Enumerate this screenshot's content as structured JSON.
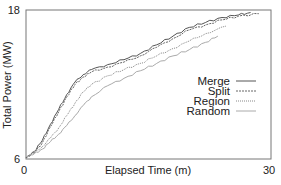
{
  "chart_data": {
    "type": "line",
    "title": "",
    "xlabel": "Elapsed Time (m)",
    "ylabel": "Total Power (MW)",
    "xlim": [
      0,
      30
    ],
    "ylim": [
      6,
      18
    ],
    "x_ticks": [
      "0",
      "30"
    ],
    "y_ticks": [
      "6",
      "18"
    ],
    "grid": false,
    "legend_position": "center-right",
    "series": [
      {
        "name": "Merge",
        "style": "solid",
        "color": "#555555",
        "x": [
          0,
          1,
          2,
          3,
          4,
          5,
          6,
          7,
          8,
          10,
          12,
          14,
          16,
          18,
          20,
          22,
          24,
          26,
          27.5
        ],
        "y": [
          6.1,
          6.6,
          7.5,
          8.8,
          10.0,
          11.2,
          12.2,
          12.8,
          13.2,
          13.6,
          14.0,
          14.5,
          15.2,
          15.9,
          16.6,
          17.0,
          17.4,
          17.6,
          17.8
        ]
      },
      {
        "name": "Split",
        "style": "dashed",
        "color": "#666666",
        "x": [
          0,
          1,
          2,
          3,
          4,
          5,
          6,
          7,
          8,
          10,
          12,
          14,
          16,
          18,
          20,
          22,
          24,
          26,
          28.5
        ],
        "y": [
          6.1,
          6.5,
          7.3,
          8.6,
          9.8,
          11.0,
          12.0,
          12.6,
          13.0,
          13.4,
          13.8,
          14.3,
          15.0,
          15.7,
          16.4,
          16.8,
          17.2,
          17.5,
          17.7
        ]
      },
      {
        "name": "Region",
        "style": "dotted",
        "color": "#888888",
        "x": [
          0,
          1,
          2,
          3,
          4,
          5,
          6,
          7,
          8,
          10,
          12,
          14,
          16,
          18,
          20,
          22,
          24.5
        ],
        "y": [
          6.2,
          6.5,
          7.0,
          7.7,
          8.5,
          9.5,
          10.5,
          11.4,
          12.0,
          12.7,
          13.2,
          13.7,
          14.3,
          14.9,
          15.5,
          16.1,
          16.7
        ]
      },
      {
        "name": "Random",
        "style": "solid-light",
        "color": "#aaaaaa",
        "x": [
          0,
          1,
          2,
          3,
          4,
          5,
          6,
          7,
          8,
          10,
          12,
          14,
          16,
          18,
          20,
          22,
          23.5
        ],
        "y": [
          6.2,
          6.4,
          6.8,
          7.4,
          8.0,
          8.7,
          9.5,
          10.3,
          11.0,
          11.9,
          12.5,
          13.1,
          13.7,
          14.3,
          14.8,
          15.4,
          15.9
        ]
      }
    ]
  },
  "plot": {
    "x_tick_min": "0",
    "x_tick_max": "30",
    "y_tick_min": "6",
    "y_tick_max": "18",
    "xlabel": "Elapsed Time (m)",
    "ylabel": "Total Power (MW)"
  },
  "legend": {
    "items": [
      "Merge",
      "Split",
      "Region",
      "Random"
    ]
  }
}
